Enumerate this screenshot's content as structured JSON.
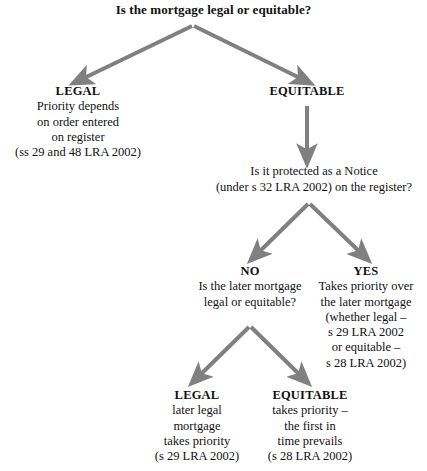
{
  "diagram": {
    "type": "decision-tree",
    "title": "Is the mortgage legal or equitable?",
    "arrow_color": "#808080",
    "text_color": "#111111",
    "background_color": "#ffffff"
  },
  "nodes": {
    "root_question": {
      "label": "Is the mortgage legal or equitable?"
    },
    "legal_top": {
      "heading": "LEGAL",
      "lines": [
        "Priority depends",
        "on order entered",
        "on register",
        "(ss 29 and 48 LRA 2002)"
      ]
    },
    "equitable_top": {
      "heading": "EQUITABLE",
      "lines": []
    },
    "notice_question": {
      "lines": [
        "Is it protected as a Notice",
        "(under s 32 LRA 2002) on the register?"
      ]
    },
    "no_branch": {
      "heading": "NO",
      "lines": [
        "Is the later mortgage",
        "legal or equitable?"
      ]
    },
    "yes_branch": {
      "heading": "YES",
      "lines": [
        "Takes priority over",
        "the later mortgage",
        "(whether legal –",
        "s 29 LRA 2002",
        "or equitable –",
        "s 28 LRA 2002)"
      ]
    },
    "legal_bottom": {
      "heading": "LEGAL",
      "lines": [
        "later legal",
        "mortgage",
        "takes priority",
        "(s 29 LRA 2002)"
      ]
    },
    "equitable_bottom": {
      "heading": "EQUITABLE",
      "lines": [
        "takes priority –",
        "the first in",
        "time prevails",
        "(s 28 LRA 2002)"
      ]
    }
  }
}
